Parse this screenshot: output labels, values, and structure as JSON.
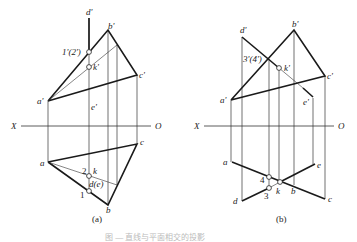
{
  "figure": {
    "panels": [
      {
        "id": "a",
        "caption": "(a)",
        "axis": {
          "left_label": "X",
          "right_label": "O"
        },
        "labels": {
          "d_prime": "d'",
          "b_prime": "b'",
          "one_two_prime": "1'(2')",
          "k_prime": "k'",
          "c_prime": "c'",
          "a_prime": "a'",
          "e_prime": "e'",
          "a": "a",
          "c": "c",
          "two": "2",
          "k": "k",
          "d_e": "d(e)",
          "one": "1",
          "b": "b"
        }
      },
      {
        "id": "b",
        "caption": "(b)",
        "axis": {
          "left_label": "X",
          "right_label": "O"
        },
        "labels": {
          "d_prime": "d'",
          "b_prime": "b'",
          "three_four_prime": "3'(4')",
          "k_prime": "k'",
          "c_prime": "c'",
          "a_prime": "a'",
          "e_prime": "e'",
          "a": "a",
          "e": "e",
          "four": "4",
          "three": "3",
          "k": "k",
          "b": "b",
          "d": "d",
          "c": "c"
        }
      }
    ],
    "figure_caption": "图 — 直线与平面相交的投影"
  }
}
